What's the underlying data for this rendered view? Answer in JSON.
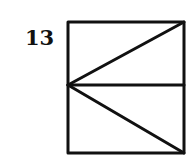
{
  "figure": {
    "label": "13",
    "stroke_color": "#111111",
    "box": {
      "x1": 68,
      "y1": 22,
      "x2": 184,
      "y2": 153
    },
    "mid_y": 85,
    "lines": [
      {
        "name": "top-edge",
        "from": [
          68,
          22
        ],
        "to": [
          184,
          22
        ]
      },
      {
        "name": "bottom-edge",
        "from": [
          68,
          153
        ],
        "to": [
          184,
          153
        ]
      },
      {
        "name": "left-edge",
        "from": [
          68,
          22
        ],
        "to": [
          68,
          153
        ]
      },
      {
        "name": "right-edge",
        "from": [
          184,
          22
        ],
        "to": [
          184,
          153
        ]
      },
      {
        "name": "middle-horizontal",
        "from": [
          68,
          85
        ],
        "to": [
          184,
          85
        ]
      },
      {
        "name": "diagonal-upper",
        "from": [
          68,
          85
        ],
        "to": [
          184,
          22
        ]
      },
      {
        "name": "diagonal-lower",
        "from": [
          68,
          85
        ],
        "to": [
          184,
          153
        ]
      }
    ]
  }
}
